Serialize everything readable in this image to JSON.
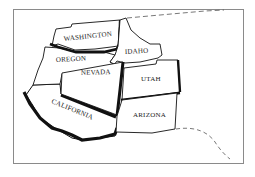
{
  "map": {
    "title": "",
    "states": [
      {
        "name": "WASHINGTON",
        "label": "WASHINGTON"
      },
      {
        "name": "OREGON",
        "label": "OREGON"
      },
      {
        "name": "IDAHO",
        "label": "IDAHO"
      },
      {
        "name": "NEVADA",
        "label": "NEVADA"
      },
      {
        "name": "UTAH",
        "label": "UTAH"
      },
      {
        "name": "CALIFORNIA",
        "label": "CALIFORNIA"
      },
      {
        "name": "ARIZONA",
        "label": "ARIZONA"
      }
    ],
    "colors": {
      "frame": "#888888",
      "outline": "#111111",
      "fill": "#ffffff",
      "dashed": "#555555"
    }
  }
}
